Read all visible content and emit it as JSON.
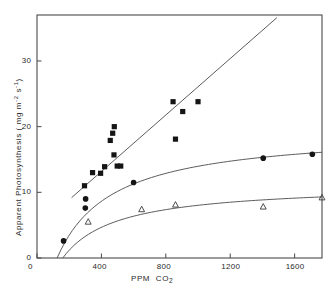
{
  "chart_data": {
    "type": "scatter",
    "title": "",
    "xlabel": "PPM  CO2",
    "ylabel": "Apparent Photosynthesis ( mg  m-2 s-1)",
    "xlim": [
      0,
      1770
    ],
    "ylim": [
      0,
      37
    ],
    "xticks": [
      0,
      400,
      800,
      1200,
      1600
    ],
    "xtick_labels": [
      "0",
      "400",
      "800",
      "1200",
      "1600"
    ],
    "yticks": [
      0,
      10,
      20,
      30
    ],
    "ytick_labels": [
      "0",
      "10",
      "20",
      "30"
    ],
    "grid": false,
    "legend": "none",
    "frame": "box",
    "series": [
      {
        "name": "filled-square-series",
        "marker": "filled-square",
        "color": "#151515",
        "points": [
          [
            295,
            11.0
          ],
          [
            345,
            13.0
          ],
          [
            395,
            12.9
          ],
          [
            420,
            13.9
          ],
          [
            455,
            17.9
          ],
          [
            470,
            19.0
          ],
          [
            478,
            15.7
          ],
          [
            480,
            20.0
          ],
          [
            498,
            14.0
          ],
          [
            520,
            14.0
          ],
          [
            845,
            23.8
          ],
          [
            860,
            18.1
          ],
          [
            905,
            22.3
          ],
          [
            1000,
            23.8
          ]
        ],
        "fit": {
          "type": "line",
          "x_start": 215,
          "y_start": 9.2,
          "x_end": 1490,
          "y_end": 36.6
        }
      },
      {
        "name": "filled-circle-series",
        "marker": "filled-circle",
        "color": "#151515",
        "points": [
          [
            165,
            2.6
          ],
          [
            300,
            7.6
          ],
          [
            302,
            9.0
          ],
          [
            600,
            11.5
          ],
          [
            1405,
            15.2
          ],
          [
            1710,
            15.8
          ]
        ],
        "fit": {
          "type": "saturating-curve",
          "x_start": 125,
          "y_start": 0.0,
          "x_end": 1770,
          "y_end": 16.1
        }
      },
      {
        "name": "open-triangle-series",
        "marker": "open-triangle",
        "color": "#3a3a3a",
        "points": [
          [
            318,
            5.5
          ],
          [
            650,
            7.4
          ],
          [
            860,
            8.1
          ],
          [
            1405,
            7.8
          ],
          [
            1770,
            9.2
          ]
        ],
        "fit": {
          "type": "saturating-curve",
          "x_start": 160,
          "y_start": 0.0,
          "x_end": 1770,
          "y_end": 9.3
        }
      }
    ]
  }
}
